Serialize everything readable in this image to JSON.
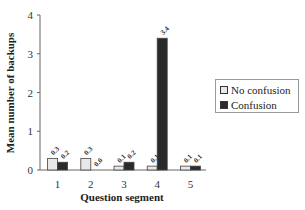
{
  "chart_data": {
    "type": "bar",
    "title": "",
    "xlabel": "Question segment",
    "ylabel": "Mean number of backups",
    "categories": [
      "1",
      "2",
      "3",
      "4",
      "5"
    ],
    "series": [
      {
        "name": "No confusion",
        "values": [
          0.3,
          0.3,
          0.1,
          0.1,
          0.1
        ],
        "labels": [
          "0.3",
          "0.3",
          "0.1",
          "0.1",
          "0.1"
        ],
        "color": "#e8e8e8"
      },
      {
        "name": "Confusion",
        "values": [
          0.2,
          0.0,
          0.2,
          3.4,
          0.1
        ],
        "labels": [
          "0.2",
          "0.0",
          "0.2",
          "3.4",
          "0.1"
        ],
        "color": "#2a2a2a"
      }
    ],
    "ylim": [
      0,
      4
    ],
    "yticks": [
      "0",
      "1",
      "2",
      "3",
      "4"
    ],
    "grid": false,
    "legend_position": "right"
  },
  "legend": {
    "items": [
      {
        "label": "No confusion",
        "color": "#e8e8e8"
      },
      {
        "label": "Confusion",
        "color": "#2a2a2a"
      }
    ]
  }
}
